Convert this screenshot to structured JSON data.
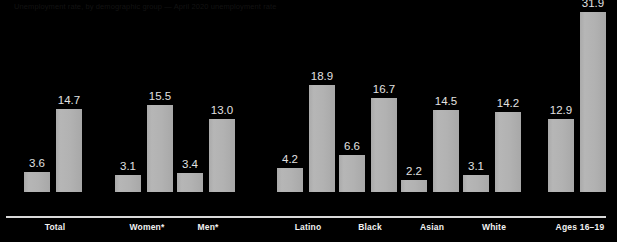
{
  "header": {
    "text": "Unemployment rate, by demographic group  —  April 2020 unemployment rate"
  },
  "chart_data": {
    "type": "bar",
    "title": "",
    "subtitle": "",
    "xlabel": "",
    "ylabel": "",
    "grid": false,
    "legend_position": "none",
    "ylim": [
      0,
      34
    ],
    "categories": [
      "Total",
      "Women*",
      "Men*",
      "Latino",
      "Black",
      "Asian",
      "White",
      "Ages 16–19"
    ],
    "series": [
      {
        "name": "Before",
        "values": [
          3.6,
          3.1,
          3.4,
          4.2,
          6.6,
          2.2,
          3.1,
          12.9
        ]
      },
      {
        "name": "After",
        "values": [
          14.7,
          15.5,
          13.0,
          18.9,
          16.7,
          14.5,
          14.2,
          31.9
        ]
      }
    ],
    "value_labels": [
      [
        "3.6",
        "14.7"
      ],
      [
        "3.1",
        "15.5"
      ],
      [
        "3.4",
        "13.0"
      ],
      [
        "4.2",
        "18.9"
      ],
      [
        "6.6",
        "16.7"
      ],
      [
        "2.2",
        "14.5"
      ],
      [
        "3.1",
        "14.2"
      ],
      [
        "12.9",
        "31.9"
      ]
    ],
    "colors": {
      "background": "#000000",
      "bar": "#b2b2b2",
      "axis": "#d8d8d8",
      "value_text": "#e2e2e2",
      "category_text": "#f2f2f2"
    }
  },
  "layout": {
    "group_left_px": [
      24,
      115,
      177,
      277,
      339,
      401,
      463,
      548
    ],
    "label_center_px": [
      55,
      147,
      208,
      308,
      370,
      432,
      494,
      580
    ],
    "baseline_y_px": 216,
    "px_per_unit": 5.64
  }
}
